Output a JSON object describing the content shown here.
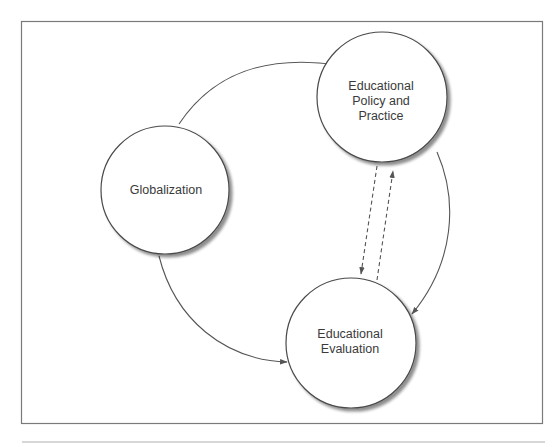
{
  "diagram": {
    "frame_color": "#7a7a7a",
    "edge_color": "#555555",
    "node_stroke": "#4a4a4a",
    "text_color": "#3a3a3a",
    "nodes": [
      {
        "id": "globalization",
        "lines": [
          "Globalization"
        ]
      },
      {
        "id": "policy",
        "lines": [
          "Educational",
          "Policy and",
          "Practice"
        ]
      },
      {
        "id": "evaluation",
        "lines": [
          "Educational",
          "Evaluation"
        ]
      }
    ],
    "edges": [
      {
        "from": "globalization",
        "to": "policy",
        "style": "solid"
      },
      {
        "from": "globalization",
        "to": "evaluation",
        "style": "solid"
      },
      {
        "from": "policy",
        "to": "evaluation",
        "style": "solid"
      },
      {
        "from": "policy",
        "to": "evaluation",
        "style": "dashed"
      },
      {
        "from": "evaluation",
        "to": "policy",
        "style": "dashed"
      }
    ]
  }
}
